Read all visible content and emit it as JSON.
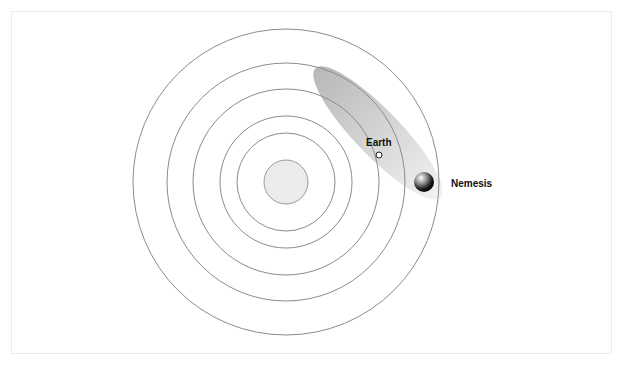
{
  "diagram": {
    "type": "orbital-diagram",
    "labels": {
      "earth": "Earth",
      "nemesis": "Nemesis"
    },
    "sun": {
      "cx": 286,
      "cy": 182,
      "r": 22,
      "fill": "#e8e8e8",
      "stroke": "#9a9a9a"
    },
    "orbits": [
      {
        "r": 153
      },
      {
        "r": 119
      },
      {
        "r": 93
      },
      {
        "r": 66
      },
      {
        "r": 49
      }
    ],
    "orbit_stroke": "#8c8c8c",
    "nemesis_orbit": {
      "cx": 378,
      "cy": 133,
      "rx": 90,
      "ry": 23,
      "rotation": 46
    },
    "earth": {
      "cx": 379,
      "cy": 155,
      "r": 3
    },
    "nemesis": {
      "cx": 424,
      "cy": 182,
      "r": 10
    }
  }
}
